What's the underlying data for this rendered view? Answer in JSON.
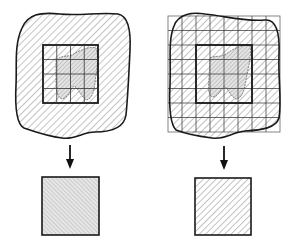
{
  "diagram": {
    "type": "sampling-domain-illustration",
    "background": "#ffffff",
    "stroke_color": "#1a1a1a",
    "hatch_color": "#777777",
    "fill_gray": "#d8d8d8",
    "panels": [
      {
        "id": "left",
        "description": "Irregular hatched domain with a central square window subdivided into a 4x4 grid; a lighter irregular region inside the window; arrow down to a resulting uniformly fine-hatched square",
        "inner_grid": {
          "rows": 4,
          "cols": 4
        },
        "outer_grid": null,
        "result_square_hatch": "fine"
      },
      {
        "id": "right",
        "description": "Irregular hatched domain fully covered by a regular grid; central square window outlined in bold; lighter irregular region inside the window; arrow down to a resulting coarse-hatched square",
        "inner_grid": null,
        "outer_grid": {
          "rows": 9,
          "cols": 8
        },
        "result_square_hatch": "coarse"
      }
    ]
  }
}
